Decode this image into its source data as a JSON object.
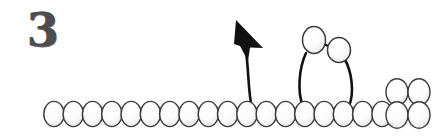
{
  "figure": {
    "step_label": "3",
    "caption": "",
    "background_color": "#ffffff",
    "outline_color": "#3a3a3a",
    "fill_light": "#ffffff",
    "fill_shade": "#e8e8e8",
    "line_color": "#111111",
    "step_number_color": "#4d4d4d",
    "width": 444,
    "height": 140
  },
  "chart_data": {
    "type": "diagram",
    "title": "",
    "subtitle": "",
    "xlabel": "",
    "ylabel": "",
    "annotations": [
      "3"
    ],
    "legend": [],
    "grid": false,
    "bead": {
      "rx": 10.2,
      "ry": 12.6,
      "stroke_width": 1.4
    },
    "series": [
      {
        "name": "base-chain",
        "note": "horizontal row of overlapping ellipse subunits",
        "cy": 114,
        "spacing": 19.3,
        "count": 18,
        "x_start": 54,
        "values": [
          54,
          73.3,
          92.6,
          111.9,
          131.2,
          150.5,
          169.8,
          189.1,
          208.4,
          227.7,
          247,
          266.3,
          285.6,
          304.9,
          324.2,
          343.5,
          362.8,
          382.1
        ]
      },
      {
        "name": "loop-beads",
        "note": "two raised ellipses forming the top of the extruded loop",
        "points": [
          {
            "cx": 314,
            "cy": 40,
            "rx": 11.5,
            "ry": 13.5
          },
          {
            "cx": 339,
            "cy": 50,
            "rx": 11.5,
            "ry": 12.5
          }
        ]
      },
      {
        "name": "right-block",
        "note": "detached 2x2 cluster of ellipses at far right",
        "points": [
          {
            "cx": 397,
            "cy": 92
          },
          {
            "cx": 419,
            "cy": 92
          },
          {
            "cx": 397,
            "cy": 115
          },
          {
            "cx": 419,
            "cy": 115
          }
        ]
      }
    ],
    "connectors": [
      {
        "name": "loop-left-leg",
        "path": "M 303 106 C 297 92, 299 68, 306 53"
      },
      {
        "name": "loop-right-leg",
        "path": "M 349 106 C 355 92, 351 70, 345 60"
      },
      {
        "name": "loop-bridge",
        "path": "M 324 44 L 330 47"
      }
    ],
    "arrow": {
      "name": "extrusion-arrow",
      "note": "curved arrow rising from the chain, head pointing up-left",
      "path": "M 252 108 C 248 92, 249 72, 246 52",
      "head_points": "238,22 262,46 249,46 246,58",
      "tip": [
        238,
        22
      ],
      "base": [
        252,
        108
      ],
      "color": "#111111"
    }
  }
}
